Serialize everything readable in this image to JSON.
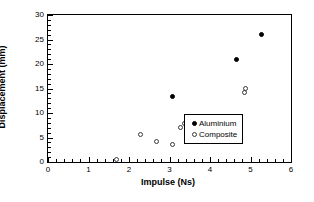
{
  "chart_data": {
    "type": "scatter",
    "title": "",
    "xlabel": "Impulse (Ns)",
    "ylabel": "Displacement (mm)",
    "xlim": [
      0,
      6
    ],
    "ylim": [
      0,
      30
    ],
    "xticks": [
      0,
      1,
      2,
      3,
      4,
      5,
      6
    ],
    "yticks": [
      0,
      5,
      10,
      15,
      20,
      25,
      30
    ],
    "xtick_labels": [
      "0",
      "1",
      "2",
      "3",
      "4",
      "5",
      "6"
    ],
    "ytick_labels": [
      "0",
      "5",
      "10",
      "15",
      "20",
      "25",
      "30"
    ],
    "x_minor_interval": 0.2,
    "y_minor_interval": 1,
    "grid": false,
    "legend_position": "lower right",
    "series": [
      {
        "name": "Aluminium",
        "marker": "filled-circle",
        "color": "#000000",
        "points": [
          {
            "x": 3.08,
            "y": 13.4
          },
          {
            "x": 4.66,
            "y": 21.0
          },
          {
            "x": 5.27,
            "y": 26.0
          }
        ]
      },
      {
        "name": "Composite",
        "marker": "open-circle",
        "color": "#3a3a3a",
        "points": [
          {
            "x": 1.7,
            "y": 0.6
          },
          {
            "x": 2.29,
            "y": 5.7
          },
          {
            "x": 2.68,
            "y": 4.1
          },
          {
            "x": 3.08,
            "y": 3.6
          },
          {
            "x": 3.27,
            "y": 7.1
          },
          {
            "x": 3.38,
            "y": 7.8
          },
          {
            "x": 3.78,
            "y": 9.2
          },
          {
            "x": 4.85,
            "y": 14.2
          },
          {
            "x": 4.87,
            "y": 15.0
          }
        ]
      }
    ]
  },
  "legend": {
    "entries": [
      {
        "label": "Aluminium",
        "marker": "filled-circle"
      },
      {
        "label": "Composite",
        "marker": "open-circle"
      }
    ]
  }
}
